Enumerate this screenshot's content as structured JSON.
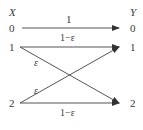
{
  "diagram": {
    "type": "channel-transition-diagram",
    "input_label": "X",
    "output_label": "Y",
    "inputs": [
      "0",
      "1",
      "2"
    ],
    "outputs": [
      "0",
      "1",
      "2"
    ],
    "transitions": [
      {
        "from": "0",
        "to": "0",
        "label": "1"
      },
      {
        "from": "1",
        "to": "1",
        "label": "1−ε"
      },
      {
        "from": "1",
        "to": "2",
        "label": "ε"
      },
      {
        "from": "2",
        "to": "1",
        "label": "ε"
      },
      {
        "from": "2",
        "to": "2",
        "label": "1−ε"
      }
    ],
    "colors": {
      "line": "#555555",
      "text": "#3a3a3a",
      "background": "#ffffff"
    }
  }
}
